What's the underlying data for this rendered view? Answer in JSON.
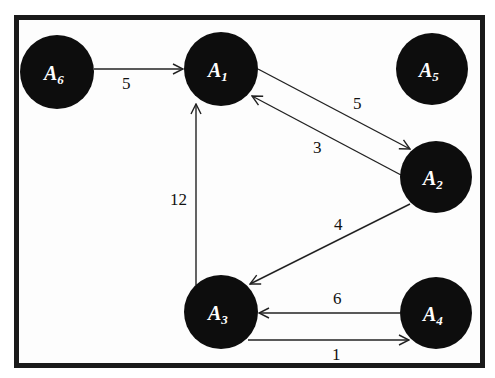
{
  "diagram": {
    "type": "directed-weighted-graph",
    "nodes": [
      {
        "id": "A6",
        "base": "A",
        "sub": "6",
        "cx": 57,
        "cy": 72
      },
      {
        "id": "A1",
        "base": "A",
        "sub": "1",
        "cx": 221,
        "cy": 72
      },
      {
        "id": "A5",
        "base": "A",
        "sub": "5",
        "cx": 432,
        "cy": 70
      },
      {
        "id": "A2",
        "base": "A",
        "sub": "2",
        "cx": 437,
        "cy": 177
      },
      {
        "id": "A3",
        "base": "A",
        "sub": "3",
        "cx": 221,
        "cy": 330
      },
      {
        "id": "A4",
        "base": "A",
        "sub": "4",
        "cx": 437,
        "cy": 330
      }
    ],
    "edges": [
      {
        "from": "A6",
        "to": "A1",
        "weight": "5"
      },
      {
        "from": "A1",
        "to": "A2",
        "weight": "5"
      },
      {
        "from": "A2",
        "to": "A1",
        "weight": "3"
      },
      {
        "from": "A2",
        "to": "A3",
        "weight": "4"
      },
      {
        "from": "A3",
        "to": "A1",
        "weight": "12"
      },
      {
        "from": "A4",
        "to": "A3",
        "weight": "6"
      },
      {
        "from": "A3",
        "to": "A4",
        "weight": "1"
      }
    ],
    "colors": {
      "node_fill": "#0d0d0d",
      "node_text": "#ffffff",
      "edge": "#222222",
      "frame": "#1a1a1a"
    }
  }
}
